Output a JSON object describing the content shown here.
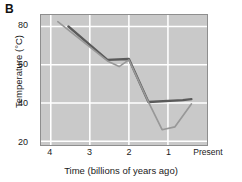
{
  "panel": {
    "label": "B"
  },
  "axes": {
    "ylabel": "Temperature (°C)",
    "xlabel": "Time (billions of years ago)",
    "yticks": [
      "80",
      "60",
      "40",
      "20"
    ],
    "xticks": [
      "4",
      "3",
      "2",
      "1",
      "Present"
    ]
  },
  "colors": {
    "plot_background": "#c9c9c9",
    "gridline": "#ffffff",
    "axis_border": "#8e8e8e",
    "series_dark": "#5a5a5a",
    "series_light": "#989898",
    "text": "#1a1a1a"
  },
  "chart_data": {
    "type": "line",
    "title": "B",
    "xlabel": "Time (billions of years ago)",
    "ylabel": "Temperature (°C)",
    "xlim": [
      4.25,
      0.0
    ],
    "ylim": [
      18,
      86
    ],
    "x_reversed": true,
    "grid": true,
    "legend": "none",
    "xtick_values": [
      4,
      3,
      2,
      1,
      0
    ],
    "xtick_labels": [
      "4",
      "3",
      "2",
      "1",
      "Present"
    ],
    "ytick_values": [
      80,
      60,
      40,
      20
    ],
    "ytick_labels": [
      "80",
      "60",
      "40",
      "20"
    ],
    "series": [
      {
        "name": "upper-estimate",
        "color": "#5a5a5a",
        "x": [
          3.55,
          2.55,
          2.0,
          1.5,
          0.62,
          0.4
        ],
        "y": [
          80.0,
          62.5,
          63.0,
          40.5,
          41.5,
          42.0
        ]
      },
      {
        "name": "lower-estimate",
        "color": "#989898",
        "x": [
          3.82,
          2.55,
          2.25,
          2.0,
          1.5,
          1.15,
          0.82,
          0.4
        ],
        "y": [
          82.5,
          62.0,
          59.0,
          62.5,
          40.5,
          26.0,
          27.5,
          39.5
        ]
      }
    ]
  }
}
